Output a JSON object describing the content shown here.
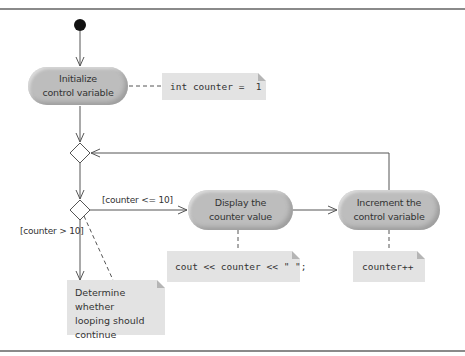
{
  "diagram": {
    "type": "UML activity diagram",
    "actions": [
      {
        "id": "init",
        "label_line1": "Initialize",
        "label_line2": "control variable"
      },
      {
        "id": "display",
        "label_line1": "Display the",
        "label_line2": "counter value"
      },
      {
        "id": "increment",
        "label_line1": "Increment the",
        "label_line2": "control variable"
      }
    ],
    "notes": {
      "init_code": "int counter =  1",
      "display_code": "cout << counter << \" \";",
      "increment_code": "counter++",
      "decision_line1": "Determine whether",
      "decision_line2": "looping should",
      "decision_line3": "continue"
    },
    "guards": {
      "continue": "[counter <= 10]",
      "exit": "[counter > 10]"
    },
    "nodes": {
      "initial": "initial-node",
      "merge": "merge-node",
      "decision": "decision-node",
      "final": "final-node"
    },
    "colors": {
      "action_fill": "#bdbdbd",
      "note_fill": "#e3e3e3",
      "line": "#555555",
      "frame": "#8a8a8a"
    }
  }
}
